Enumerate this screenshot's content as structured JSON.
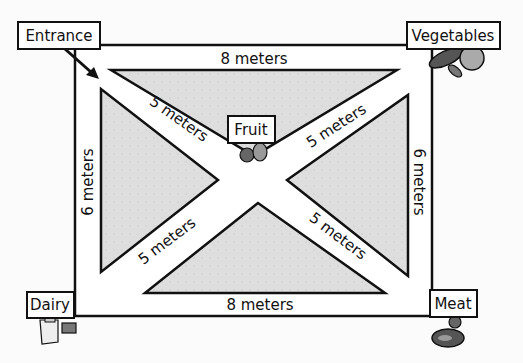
{
  "diagram": {
    "signs": {
      "entrance": "Entrance",
      "vegetables": "Vegetables",
      "dairy": "Dairy",
      "meat": "Meat",
      "fruit": "Fruit"
    },
    "measurements": {
      "top": "8 meters",
      "bottom": "8 meters",
      "left": "6 meters",
      "right": "6 meters",
      "diag_upper_left": "5 meters",
      "diag_upper_right": "5 meters",
      "diag_lower_left": "5 meters",
      "diag_lower_right": "5 meters"
    },
    "colors": {
      "grass": "#dcdcdc",
      "path": "#ffffff",
      "outline": "#111111",
      "produce_dark": "#555555",
      "produce_light": "#9a9a9a"
    }
  }
}
